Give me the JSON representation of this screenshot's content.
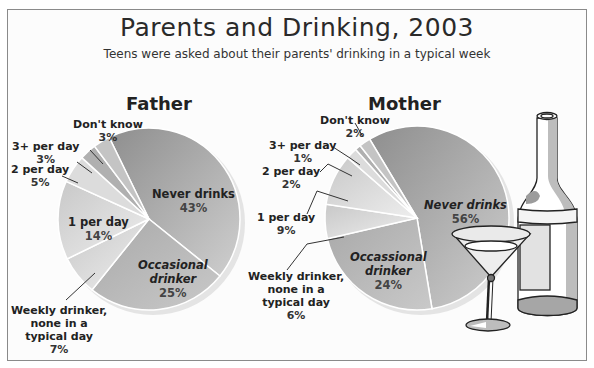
{
  "title": "Parents and Drinking, 2003",
  "subtitle": "Teens were asked about their parents' drinking in a typical week",
  "father": {
    "title": "Father",
    "labels": {
      "never": {
        "name": "Never drinks",
        "pct": "43%"
      },
      "occasional": {
        "name1": "Occasional",
        "name2": "drinker",
        "pct": "25%"
      },
      "weekly": {
        "name1": "Weekly drinker,",
        "name2": "none in a",
        "name3": "typical day",
        "pct": "7%"
      },
      "one": {
        "name": "1 per day",
        "pct": "14%"
      },
      "two": {
        "name": "2 per day",
        "pct": "5%"
      },
      "three": {
        "name": "3+ per day",
        "pct": "3%"
      },
      "dk": {
        "name": "Don't know",
        "pct": "3%"
      }
    }
  },
  "mother": {
    "title": "Mother",
    "labels": {
      "never": {
        "name": "Never drinks",
        "pct": "56%"
      },
      "occasional": {
        "name1": "Occassional",
        "name2": "drinker",
        "pct": "24%"
      },
      "weekly": {
        "name1": "Weekly drinker,",
        "name2": "none in a",
        "name3": "typical day",
        "pct": "6%"
      },
      "one": {
        "name": "1 per day",
        "pct": "9%"
      },
      "two": {
        "name": "2 per day",
        "pct": "2%"
      },
      "three": {
        "name": "3+ per day",
        "pct": "1%"
      },
      "dk": {
        "name": "Don't know",
        "pct": "2%"
      }
    }
  },
  "chart_data": [
    {
      "type": "pie",
      "title": "Father",
      "chart_title": "Parents and Drinking, 2003",
      "subtitle": "Teens were asked about their parents' drinking in a typical week",
      "categories": [
        "Never drinks",
        "Occasional drinker",
        "Weekly drinker, none in a typical day",
        "1 per day",
        "2 per day",
        "3+ per day",
        "Don't know"
      ],
      "values": [
        43,
        25,
        7,
        14,
        5,
        3,
        3
      ],
      "unit": "%"
    },
    {
      "type": "pie",
      "title": "Mother",
      "chart_title": "Parents and Drinking, 2003",
      "subtitle": "Teens were asked about their parents' drinking in a typical week",
      "categories": [
        "Never drinks",
        "Occassional drinker",
        "Weekly drinker, none in a typical day",
        "1 per day",
        "2 per day",
        "3+ per day",
        "Don't know"
      ],
      "values": [
        56,
        24,
        6,
        9,
        2,
        1,
        2
      ],
      "unit": "%"
    }
  ],
  "colors": {
    "never": "#9a9a9a",
    "occasional": "#b4b4b4",
    "weekly": "#e6e6e6",
    "one": "#d0d0d0",
    "two": "#dcdcdc",
    "three": "#a8a8a8",
    "dk": "#c4c4c4",
    "rim": "#e9e9e9"
  }
}
